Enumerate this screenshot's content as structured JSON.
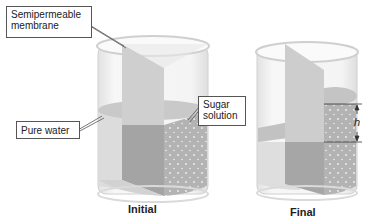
{
  "diagram": {
    "labels": {
      "membrane": "Semipermeable membrane",
      "membrane_line1": "Semipermeable",
      "membrane_line2": "membrane",
      "pure_water": "Pure water",
      "sugar_line1": "Sugar",
      "sugar_line2": "solution",
      "height": "h"
    },
    "captions": {
      "initial": "Initial",
      "final": "Final"
    },
    "colors": {
      "water": "#c8c8c8",
      "solution": "#a9a9a9",
      "membrane": "#bdbdbd",
      "glass": "#e6e6e6",
      "outline": "#555555"
    }
  }
}
